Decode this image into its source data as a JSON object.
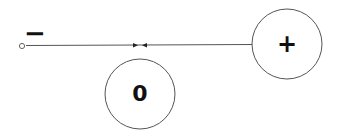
{
  "diagram": {
    "nodes": [
      {
        "id": "plus",
        "label": "+",
        "shape": "circle"
      },
      {
        "id": "zero",
        "label": "0",
        "shape": "circle"
      },
      {
        "id": "minus",
        "label": "−",
        "shape": "small-open-circle"
      }
    ],
    "edges": [
      {
        "from": "minus",
        "to": "midpoint",
        "arrow": "forward"
      },
      {
        "from": "plus",
        "to": "midpoint",
        "arrow": "forward"
      }
    ]
  },
  "labels": {
    "plus": "+",
    "zero": "0",
    "minus": "−"
  },
  "colors": {
    "stroke": "#555555",
    "text": "#111111",
    "background": "#ffffff"
  }
}
